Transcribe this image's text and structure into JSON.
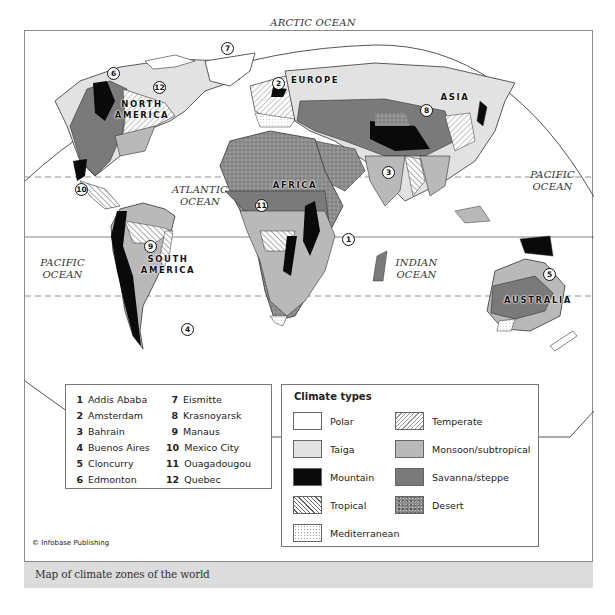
{
  "caption": "Map of climate zones of the world",
  "credit": "© Infobase Publishing",
  "map": {
    "oceans": [
      {
        "id": "arctic",
        "label": "ARCTIC OCEAN"
      },
      {
        "id": "atlantic",
        "label_line1": "ATLANTIC",
        "label_line2": "OCEAN"
      },
      {
        "id": "pacific-east",
        "label_line1": "PACIFIC",
        "label_line2": "OCEAN"
      },
      {
        "id": "pacific-west",
        "label_line1": "PACIFIC",
        "label_line2": "OCEAN"
      },
      {
        "id": "indian",
        "label_line1": "INDIAN",
        "label_line2": "OCEAN"
      }
    ],
    "continents": [
      {
        "id": "north-america",
        "line1": "NORTH",
        "line2": "AMERICA"
      },
      {
        "id": "south-america",
        "line1": "SOUTH",
        "line2": "AMERICA"
      },
      {
        "id": "europe",
        "line1": "EUROPE"
      },
      {
        "id": "asia",
        "line1": "ASIA"
      },
      {
        "id": "africa",
        "line1": "AFRICA"
      },
      {
        "id": "australia",
        "line1": "AUSTRALIA"
      }
    ],
    "markers": [
      "1",
      "2",
      "3",
      "4",
      "5",
      "6",
      "7",
      "8",
      "9",
      "10",
      "11",
      "12"
    ]
  },
  "cities": {
    "left": [
      {
        "num": "1",
        "name": "Addis Ababa"
      },
      {
        "num": "2",
        "name": "Amsterdam"
      },
      {
        "num": "3",
        "name": "Bahrain"
      },
      {
        "num": "4",
        "name": "Buenos Aires"
      },
      {
        "num": "5",
        "name": "Cloncurry"
      },
      {
        "num": "6",
        "name": "Edmonton"
      }
    ],
    "right": [
      {
        "num": "7",
        "name": "Eismitte"
      },
      {
        "num": "8",
        "name": "Krasnoyarsk"
      },
      {
        "num": "9",
        "name": "Manaus"
      },
      {
        "num": "10",
        "name": "Mexico City"
      },
      {
        "num": "11",
        "name": "Ouagadougou"
      },
      {
        "num": "12",
        "name": "Quebec"
      }
    ]
  },
  "legend": {
    "title": "Climate types",
    "items": [
      {
        "label": "Polar",
        "pattern": "polar",
        "color": "#ffffff"
      },
      {
        "label": "Taiga",
        "pattern": "taiga",
        "color": "#e2e2e2"
      },
      {
        "label": "Mountain",
        "pattern": "mountain",
        "color": "#0a0a0a"
      },
      {
        "label": "Tropical",
        "pattern": "tropical",
        "color": "#ffffff"
      },
      {
        "label": "Mediterranean",
        "pattern": "mediterranean",
        "color": "#ffffff"
      },
      {
        "label": "Temperate",
        "pattern": "temperate",
        "color": "#ffffff"
      },
      {
        "label": "Monsoon/subtropical",
        "pattern": "monsoon",
        "color": "#b9b9b9"
      },
      {
        "label": "Savanna/steppe",
        "pattern": "savanna",
        "color": "#7a7a7a"
      },
      {
        "label": "Desert",
        "pattern": "desert",
        "color": "#8c8c8c"
      }
    ]
  }
}
